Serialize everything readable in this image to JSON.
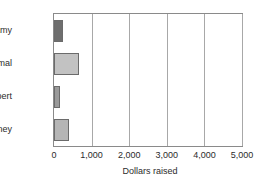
{
  "chart_data": {
    "type": "bar",
    "orientation": "horizontal",
    "title": "",
    "xlabel": "Dollars raised",
    "ylabel": "",
    "categories": [
      "Amy",
      "Jamal",
      "Robert",
      "Courtney"
    ],
    "values": [
      230,
      660,
      150,
      390
    ],
    "xlim": [
      0,
      5000
    ],
    "xticks": [
      0,
      1000,
      2000,
      3000,
      4000,
      5000
    ],
    "xtick_labels": [
      "0",
      "1,000",
      "2,000",
      "3,000",
      "4,000",
      "5,000"
    ],
    "grid": "vertical",
    "legend": "none",
    "bar_colors": [
      "#6e6e6e",
      "#c2c2c2",
      "#9a9a9a",
      "#b5b5b5"
    ],
    "bar_edge_color": "#6b6b6b",
    "frame_color": "#8a8a8a",
    "gridline_color": "#a8a8a8",
    "background": "#ffffff",
    "text_color": "#2b2b2b"
  }
}
